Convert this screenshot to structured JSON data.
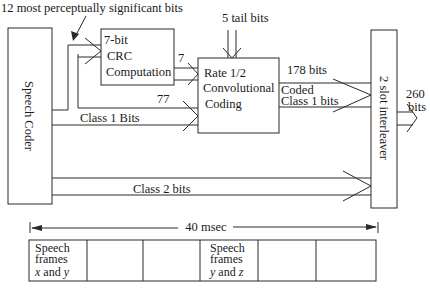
{
  "diagram": {
    "top_annotation": "12 most perceptually significant bits",
    "blocks": {
      "speech_coder": "Speech Coder",
      "crc": [
        "7-bit",
        "CRC",
        "Computation"
      ],
      "conv": [
        "Rate 1/2",
        "Convolutional",
        "Coding"
      ],
      "interleaver": "2 slot interleaver"
    },
    "edges": {
      "tail_bits": "5 tail bits",
      "crc_out": "7",
      "class1_count": "77",
      "class1_label": "Class 1 Bits",
      "conv_out_count": "178 bits",
      "conv_out_label_1": "Coded",
      "conv_out_label_2": "Class 1 bits",
      "class2_label": "Class 2 bits",
      "output_count": "260",
      "output_unit": "bits"
    },
    "timeline": {
      "label": "40 msec",
      "cells": [
        {
          "line1": "Speech",
          "line2": "frames",
          "line3a": "x",
          "line3b": " and ",
          "line3c": "y"
        },
        {
          "line1": "",
          "line2": "",
          "line3a": "",
          "line3b": "",
          "line3c": ""
        },
        {
          "line1": "",
          "line2": "",
          "line3a": "",
          "line3b": "",
          "line3c": ""
        },
        {
          "line1": "Speech",
          "line2": "frames",
          "line3a": "y",
          "line3b": " and ",
          "line3c": "z"
        },
        {
          "line1": "",
          "line2": "",
          "line3a": "",
          "line3b": "",
          "line3c": ""
        },
        {
          "line1": "",
          "line2": "",
          "line3a": "",
          "line3b": "",
          "line3c": ""
        }
      ]
    }
  }
}
